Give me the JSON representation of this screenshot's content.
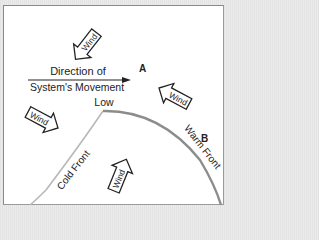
{
  "diagram": {
    "movement_label_line1": "Direction of",
    "movement_label_line2": "System's Movement",
    "point_a": "A",
    "point_b": "B",
    "low_label": "Low",
    "cold_front_label": "Cold Front",
    "warm_front_label": "Warm Front",
    "wind_arrows": [
      {
        "label": "Wind",
        "direction": "southwest"
      },
      {
        "label": "Wind",
        "direction": "northwest"
      },
      {
        "label": "Wind",
        "direction": "southeast"
      },
      {
        "label": "Wind",
        "direction": "northeast"
      }
    ],
    "colors": {
      "cold_front": "#b8b8b8",
      "warm_front": "#8c8c8c",
      "frame_bg": "#ffffff",
      "outer_bg": "#e6e6e6",
      "text": "#222222"
    }
  }
}
